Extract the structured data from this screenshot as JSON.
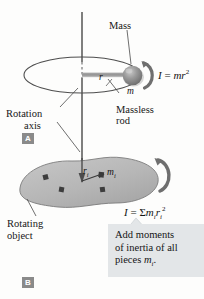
{
  "figure": {
    "panel_a": {
      "badge": "A",
      "labels": {
        "mass": "Mass",
        "massless_rod": "Massless\nrod",
        "massless_rod_line1": "Massless",
        "massless_rod_line2": "rod",
        "rotation_axis_line1": "Rotation",
        "rotation_axis_line2": "axis",
        "radius_symbol": "r",
        "mass_symbol": "m"
      },
      "equation": {
        "lhs": "I",
        "eq": " = ",
        "rhs_m": "mr",
        "rhs_exp": "2",
        "full": "I = mr²"
      }
    },
    "panel_b": {
      "badge": "B",
      "labels": {
        "rotating_object_line1": "Rotating",
        "rotating_object_line2": "object",
        "radius_symbol": "r",
        "radius_sub": "i",
        "mass_symbol": "m",
        "mass_sub": "i"
      },
      "equation": {
        "lhs": "I",
        "eq": " = ",
        "sigma": "Σ",
        "rhs_m": "m",
        "rhs_m_sub": "i",
        "rhs_r": "r",
        "rhs_r_sub": "i",
        "rhs_exp": "2",
        "full": "I = Σ mᵢrᵢ²"
      },
      "callout": {
        "line1": "Add moments",
        "line2": "of inertia of all",
        "line3_pre": "pieces ",
        "line3_var": "m",
        "line3_sub": "i",
        "line3_post": ".",
        "full": "Add moments of inertia of all pieces mi."
      }
    },
    "colors": {
      "page_background": "#fdfdfc",
      "badge_fill": "#8a8a8a",
      "badge_text": "#ffffff",
      "callout_fill": "#e3e6e8",
      "blob_fill": "#b9b9b9",
      "sphere_fill": "#8e8e8e",
      "line": "#4a4a4a",
      "text": "#171717",
      "divider": "#b0b8bd"
    }
  }
}
